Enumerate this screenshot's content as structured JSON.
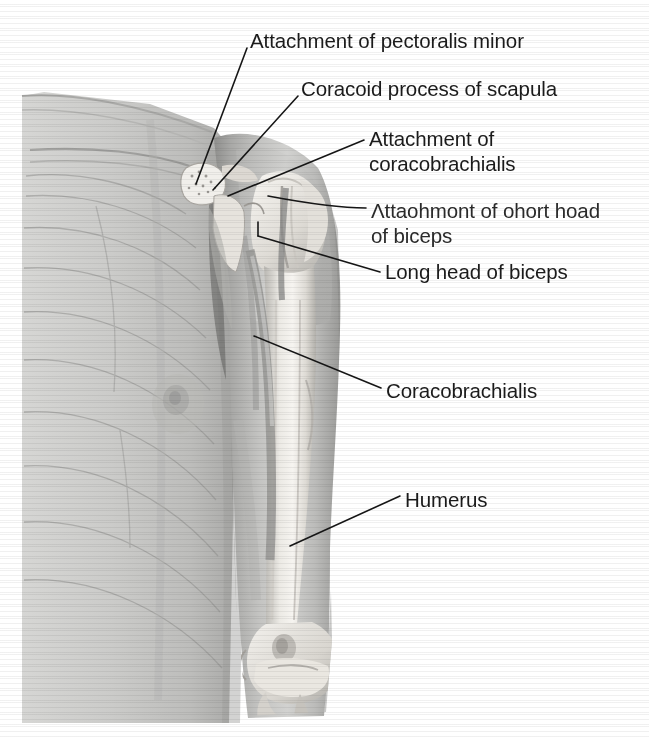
{
  "figure": {
    "type": "anatomical-illustration",
    "background_color": "#ffffff",
    "skin_tone": "#c9c9c9",
    "bone_highlight": "#f2f0ec",
    "line_color": "#1b1b1b",
    "text_color": "#1b1b1b"
  },
  "labels": [
    {
      "id": "pectoralis-minor",
      "text": "Attachment of pectoralis minor"
    },
    {
      "id": "coracoid-process",
      "text": "Coracoid process of scapula"
    },
    {
      "id": "coracobrachialis-attachment",
      "line1": "Attachment of",
      "line2": "coracobrachialis"
    },
    {
      "id": "short-head-biceps",
      "line1": "Λttaohmont of ohort hoad",
      "line2": "of biceps"
    },
    {
      "id": "long-head-biceps",
      "text": "Long head of biceps"
    },
    {
      "id": "coracobrachialis",
      "text": "Coracobrachialis"
    },
    {
      "id": "humerus",
      "text": "Humerus"
    }
  ]
}
